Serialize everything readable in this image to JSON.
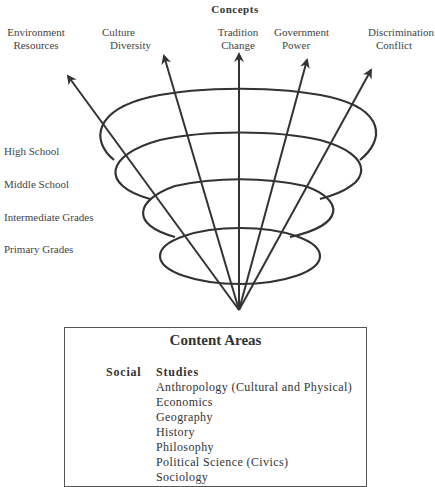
{
  "diagram": {
    "title": "Concepts",
    "concepts": [
      {
        "line1": "Environment",
        "line2": "Resources"
      },
      {
        "line1": "Culture",
        "line2": "Diversity"
      },
      {
        "line1": "Tradition",
        "line2": "Change"
      },
      {
        "line1": "Government",
        "line2": "Power"
      },
      {
        "line1": "Discrimination",
        "line2": "Conflict"
      }
    ],
    "levels": [
      {
        "label": "High School"
      },
      {
        "label": "Middle School"
      },
      {
        "label": "Intermediate Grades"
      },
      {
        "label": "Primary Grades"
      }
    ],
    "content_box": {
      "title": "Content Areas",
      "category_left": "Social",
      "category_right": "Studies",
      "subjects": [
        "Anthropology (Cultural and Physical)",
        "Economics",
        "Geography",
        "History",
        "Philosophy",
        "Political Science (Civics)",
        "Sociology"
      ]
    },
    "colors": {
      "line": "#333333",
      "text": "#333333",
      "background": "#ffffff"
    }
  }
}
